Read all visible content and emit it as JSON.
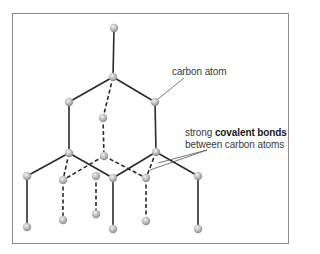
{
  "diagram": {
    "labels": {
      "carbon_atom": "carbon atom",
      "bonds_line1_prefix": "strong ",
      "bonds_line1_bold": "covalent bonds",
      "bonds_line2": "between carbon atoms"
    },
    "colors": {
      "frame": "#8a8a8a",
      "bond": "#2a2a2a",
      "atom": "#b8b8b8",
      "pointer": "#555555",
      "text": "#3a3a3a"
    },
    "atoms": [
      {
        "id": "a0",
        "x": 114,
        "y": 28
      },
      {
        "id": "a1",
        "x": 113,
        "y": 77
      },
      {
        "id": "a2",
        "x": 69,
        "y": 102
      },
      {
        "id": "a3",
        "x": 155,
        "y": 102
      },
      {
        "id": "a4",
        "x": 103,
        "y": 118
      },
      {
        "id": "a5",
        "x": 69,
        "y": 153
      },
      {
        "id": "a6",
        "x": 104,
        "y": 156
      },
      {
        "id": "a7",
        "x": 156,
        "y": 152
      },
      {
        "id": "a8",
        "x": 27,
        "y": 176
      },
      {
        "id": "a9",
        "x": 63,
        "y": 180
      },
      {
        "id": "a10",
        "x": 96,
        "y": 176
      },
      {
        "id": "a11",
        "x": 113,
        "y": 178
      },
      {
        "id": "a12",
        "x": 146,
        "y": 178
      },
      {
        "id": "a13",
        "x": 198,
        "y": 176
      },
      {
        "id": "a14",
        "x": 27,
        "y": 227
      },
      {
        "id": "a15",
        "x": 63,
        "y": 220
      },
      {
        "id": "a16",
        "x": 96,
        "y": 214
      },
      {
        "id": "a17",
        "x": 113,
        "y": 229
      },
      {
        "id": "a18",
        "x": 146,
        "y": 221
      },
      {
        "id": "a19",
        "x": 198,
        "y": 229
      }
    ],
    "bonds": [
      {
        "from": "a0",
        "to": "a1",
        "style": "solid"
      },
      {
        "from": "a1",
        "to": "a2",
        "style": "solid"
      },
      {
        "from": "a1",
        "to": "a3",
        "style": "solid"
      },
      {
        "from": "a1",
        "to": "a4",
        "style": "dashed"
      },
      {
        "from": "a2",
        "to": "a5",
        "style": "solid"
      },
      {
        "from": "a3",
        "to": "a7",
        "style": "solid"
      },
      {
        "from": "a4",
        "to": "a6",
        "style": "dashed"
      },
      {
        "from": "a5",
        "to": "a8",
        "style": "solid"
      },
      {
        "from": "a5",
        "to": "a9",
        "style": "dashed"
      },
      {
        "from": "a5",
        "to": "a11",
        "style": "solid"
      },
      {
        "from": "a6",
        "to": "a9",
        "style": "dashed"
      },
      {
        "from": "a6",
        "to": "a12",
        "style": "dashed"
      },
      {
        "from": "a7",
        "to": "a11",
        "style": "solid"
      },
      {
        "from": "a7",
        "to": "a12",
        "style": "dashed"
      },
      {
        "from": "a7",
        "to": "a13",
        "style": "solid"
      },
      {
        "from": "a8",
        "to": "a14",
        "style": "solid"
      },
      {
        "from": "a9",
        "to": "a15",
        "style": "dashed"
      },
      {
        "from": "a10",
        "to": "a16",
        "style": "dashed"
      },
      {
        "from": "a11",
        "to": "a17",
        "style": "solid"
      },
      {
        "from": "a12",
        "to": "a18",
        "style": "dashed"
      },
      {
        "from": "a13",
        "to": "a19",
        "style": "solid"
      }
    ],
    "pointers": [
      {
        "x1": 184,
        "y1": 78,
        "x2": 158,
        "y2": 99
      },
      {
        "x1": 207,
        "y1": 150,
        "x2": 158,
        "y2": 163
      },
      {
        "x1": 207,
        "y1": 150,
        "x2": 150,
        "y2": 170
      }
    ]
  }
}
